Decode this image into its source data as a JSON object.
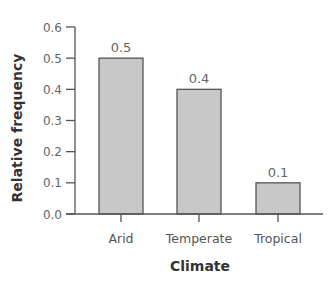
{
  "chart_data": {
    "type": "bar",
    "title": "",
    "xlabel": "Climate",
    "ylabel": "Relative frequency",
    "categories": [
      "Arid",
      "Temperate",
      "Tropical"
    ],
    "values": [
      0.5,
      0.4,
      0.1
    ],
    "data_labels": [
      "0.5",
      "0.4",
      "0.1"
    ],
    "ylim": [
      0,
      0.6
    ],
    "yticks": [
      "0.0",
      "0.1",
      "0.2",
      "0.3",
      "0.4",
      "0.5",
      "0.6"
    ],
    "grid": false,
    "legend": null
  },
  "colors": {
    "bar_fill": "#c8c8c8",
    "bar_stroke": "#555555",
    "axis": "#555555",
    "text": "#555555",
    "label": "#333333"
  }
}
